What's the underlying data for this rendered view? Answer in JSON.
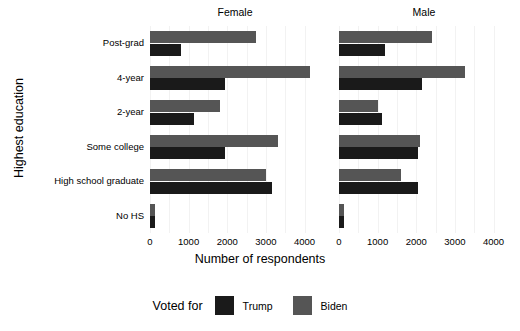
{
  "chart_data": {
    "type": "bar",
    "orientation": "horizontal",
    "title": "",
    "xlabel": "Number of respondents",
    "ylabel": "Highest education",
    "xlim": [
      0,
      4400
    ],
    "xticks": [
      0,
      1000,
      2000,
      3000,
      4000
    ],
    "xtick_labels": [
      "0",
      "1000",
      "2000",
      "3000",
      "4000"
    ],
    "categories": [
      "Post-grad",
      "4-year",
      "2-year",
      "Some college",
      "High school graduate",
      "No HS"
    ],
    "grid": "vertical-minor-only",
    "facet_label": "Gender",
    "facets": [
      {
        "name": "Female",
        "series": [
          {
            "name": "Biden",
            "color": "#555555",
            "values": [
              2750,
              4150,
              1800,
              3300,
              3000,
              130
            ]
          },
          {
            "name": "Trump",
            "color": "#1a1a1a",
            "values": [
              800,
              1950,
              1150,
              1950,
              3150,
              140
            ]
          }
        ]
      },
      {
        "name": "Male",
        "series": [
          {
            "name": "Biden",
            "color": "#555555",
            "values": [
              2400,
              3250,
              1000,
              2100,
              1600,
              120
            ]
          },
          {
            "name": "Trump",
            "color": "#1a1a1a",
            "values": [
              1200,
              2150,
              1100,
              2050,
              2050,
              130
            ]
          }
        ]
      }
    ],
    "legend": {
      "title": "Voted for",
      "position": "bottom",
      "entries": [
        {
          "label": "Trump",
          "color": "#1a1a1a"
        },
        {
          "label": "Biden",
          "color": "#555555"
        }
      ]
    }
  }
}
